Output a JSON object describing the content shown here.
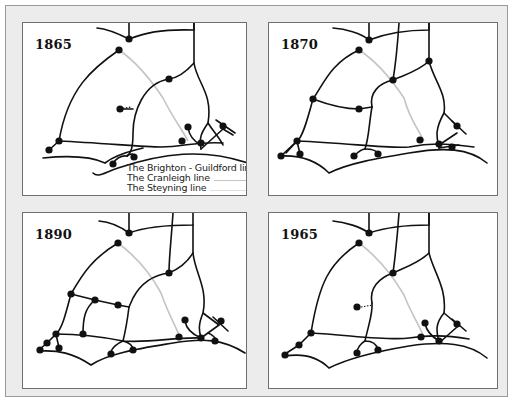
{
  "colors": {
    "rail": "#111111",
    "cranleigh": "#c4c4c4",
    "steyning": "#d8d8d8",
    "frame_bg": "#ececec",
    "panel_bg": "#ffffff"
  },
  "legend": {
    "items": [
      {
        "label": "The Brighton - Guildford link",
        "swatch": "none"
      },
      {
        "label": "The Cranleigh line",
        "swatch": "#c4c4c4"
      },
      {
        "label": "The Steyning line",
        "swatch": "#d8d8d8"
      }
    ]
  },
  "panels": [
    {
      "year": "1865",
      "position": {
        "left": 22,
        "top": 22,
        "width": 225,
        "height": 174
      },
      "lines": [
        "M106,0 L106,16",
        "M74,5 C86,6 98,12 106,16",
        "M106,16 C122,10 136,6 171,7 L171,0",
        "M171,0 L171,40 C174,60 190,70 185,100 C178,110 176,115 178,126",
        "M96,27 C70,45 45,65 36,118",
        "M36,118 L26,127",
        "M36,118 C80,120 120,124 138,124 C160,124 175,118 200,120",
        "M20,135 C40,133 65,132 82,140 C95,130 110,128 120,125",
        "M171,40 C162,50 155,55 146,56 C120,60 110,90 110,110 C110,125 108,130 104,133",
        "M104,133 C98,132 92,136 90,141",
        "M104,133 C108,130 112,130 111,136",
        "M97,86 L110,86",
        "M165,104 C166,112 170,118 178,122",
        "M185,100 C190,108 196,114 200,122",
        "M178,126 L200,106",
        "M193,97 L212,110",
        "M200,106 L210,112",
        "M70,150 C75,155 80,150 95,145 C140,130 180,125 225,140"
      ],
      "dashed": [
        "M97,86 L108,84"
      ],
      "gray": [
        "M96,27 C115,40 130,60 140,75 C150,95 160,108 165,118"
      ],
      "nodes": [
        [
          106,
          16
        ],
        [
          96,
          27
        ],
        [
          146,
          56
        ],
        [
          97,
          86
        ],
        [
          36,
          118
        ],
        [
          26,
          127
        ],
        [
          90,
          141
        ],
        [
          111,
          134
        ],
        [
          165,
          104
        ],
        [
          159,
          118
        ],
        [
          178,
          120
        ],
        [
          200,
          103
        ]
      ]
    },
    {
      "year": "1870",
      "position": {
        "left": 268,
        "top": 22,
        "width": 230,
        "height": 174
      },
      "lines": [
        "M100,0 L100,17",
        "M64,5 C76,6 92,10 100,17",
        "M100,17 C118,10 140,7 160,7 L160,0",
        "M130,0 C128,30 126,45 124,57",
        "M160,0 L160,38 C165,58 178,70 175,90 C165,108 168,115 170,125",
        "M90,27 C62,40 55,60 44,76",
        "M44,76 C40,90 34,115 28,118",
        "M28,118 L17,130",
        "M44,76 C60,82 78,86 90,86 L103,84",
        "M103,84 C100,100 100,115 96,126",
        "M28,118 C80,120 120,126 140,124 C160,120 175,120 205,124",
        "M96,126 C92,126 88,130 85,133",
        "M96,126 C104,126 108,128 109,131",
        "M12,133 C35,132 50,140 60,150 C80,140 110,135 140,130 C175,124 200,125 218,140",
        "M124,57 C110,60 100,70 103,84",
        "M160,38 C150,48 135,52 124,57",
        "M175,90 L188,103",
        "M170,122 L188,110",
        "M183,98 L197,111",
        "M170,125 L190,122",
        "M12,133 L28,118",
        "M28,118 L31,131"
      ],
      "dashed": [],
      "gray": [
        "M90,27 C110,40 125,60 135,75 C140,95 150,108 155,118"
      ],
      "nodes": [
        [
          100,
          17
        ],
        [
          90,
          27
        ],
        [
          44,
          76
        ],
        [
          90,
          86
        ],
        [
          124,
          57
        ],
        [
          160,
          38
        ],
        [
          28,
          118
        ],
        [
          12,
          133
        ],
        [
          31,
          131
        ],
        [
          85,
          133
        ],
        [
          109,
          131
        ],
        [
          151,
          117
        ],
        [
          170,
          121
        ],
        [
          183,
          124
        ],
        [
          188,
          103
        ]
      ]
    },
    {
      "year": "1890",
      "position": {
        "left": 22,
        "top": 212,
        "width": 225,
        "height": 177
      },
      "lines": [
        "M106,0 L106,20",
        "M76,8 C88,9 98,14 106,20",
        "M106,20 C122,14 140,12 170,12 L170,0",
        "M150,0 C148,30 146,45 146,60",
        "M170,12 L170,40 C172,60 185,75 180,100 C175,112 176,118 178,125",
        "M95,30 C70,45 60,60 48,81",
        "M48,81 C44,95 40,115 33,121",
        "M33,121 L24,130",
        "M24,130 L17,136",
        "M48,81 L72,87 L95,92 L106,94",
        "M72,87 C62,95 60,105 60,121",
        "M106,94 C104,110 102,120 100,128",
        "M33,121 C60,121 80,124 100,128 C130,130 150,124 178,125",
        "M100,128 C95,130 88,135 88,140",
        "M100,128 C108,130 110,134 110,137",
        "M17,138 C35,137 50,140 68,152 C85,140 120,135 150,130 C180,125 200,126 222,140",
        "M146,60 C130,62 118,70 110,85 L106,94",
        "M170,40 C165,48 158,55 146,60",
        "M180,100 L196,112",
        "M178,125 L196,112",
        "M190,104 L205,118",
        "M185,120 C190,122 192,124 194,128",
        "M33,121 L36,135",
        "M162,108 C163,114 166,120 178,125"
      ],
      "dashed": [],
      "gray": [
        "M95,30 C115,45 130,65 138,80 C145,100 152,112 156,122"
      ],
      "nodes": [
        [
          106,
          20
        ],
        [
          95,
          30
        ],
        [
          48,
          81
        ],
        [
          72,
          87
        ],
        [
          95,
          92
        ],
        [
          146,
          60
        ],
        [
          33,
          121
        ],
        [
          60,
          121
        ],
        [
          24,
          130
        ],
        [
          17,
          137
        ],
        [
          36,
          135
        ],
        [
          88,
          141
        ],
        [
          110,
          137
        ],
        [
          156,
          124
        ],
        [
          162,
          107
        ],
        [
          178,
          125
        ],
        [
          192,
          128
        ],
        [
          198,
          108
        ]
      ]
    },
    {
      "year": "1965",
      "position": {
        "left": 268,
        "top": 212,
        "width": 230,
        "height": 177
      },
      "lines": [
        "M100,0 L100,20",
        "M64,8 C76,9 92,14 100,20",
        "M100,20 C118,14 140,12 160,12 L160,0",
        "M130,0 C128,30 126,45 124,60",
        "M160,0 L160,40 C165,60 178,75 175,100 C165,112 168,120 170,130",
        "M90,30 C60,50 50,70 42,120",
        "M42,120 L30,132",
        "M30,132 L16,141",
        "M42,120 C80,122 120,128 140,125 C160,122 175,122 200,126",
        "M96,128 C100,110 104,100 103,90",
        "M96,128 C92,130 88,135 88,140",
        "M96,128 C104,128 108,132 109,137",
        "M16,143 C35,140 50,145 60,155 C80,145 110,138 140,133 C175,128 200,130 218,145",
        "M124,60 C110,65 100,75 103,90",
        "M160,40 C150,50 135,55 124,60",
        "M175,100 L188,111",
        "M170,130 L188,114",
        "M183,106 L197,118",
        "M156,110 C157,116 160,122 170,128"
      ],
      "dashed": [
        "M92,94 L104,92"
      ],
      "gray": [
        "M90,30 C110,45 125,65 135,82 C142,100 150,112 154,122"
      ],
      "nodes": [
        [
          100,
          20
        ],
        [
          90,
          30
        ],
        [
          124,
          60
        ],
        [
          88,
          94
        ],
        [
          42,
          120
        ],
        [
          30,
          132
        ],
        [
          16,
          142
        ],
        [
          88,
          140
        ],
        [
          109,
          137
        ],
        [
          152,
          124
        ],
        [
          156,
          110
        ],
        [
          170,
          128
        ],
        [
          188,
          111
        ]
      ]
    }
  ]
}
